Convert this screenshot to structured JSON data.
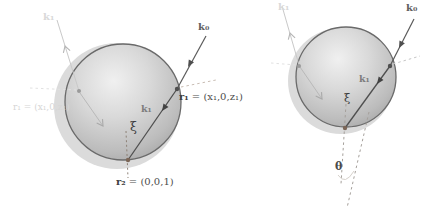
{
  "left": {
    "labels": {
      "k0": "k₀",
      "k1": "k₁",
      "xi": "ξ",
      "r1_bold": "r₁",
      "r1_rest": " = (x₁,0,z₁)",
      "r2_bold": "r₂",
      "r2_rest": " = (0,0,1)",
      "ghost_r1": "r₁ = (x₁,0,z₁)",
      "ghost_k": "k₁"
    }
  },
  "right": {
    "labels": {
      "k0": "k₀",
      "k1": "k₁",
      "xi": "ξ",
      "theta": "θ",
      "ghost_k": "k₁"
    }
  },
  "colors": {
    "sphere_outline": "#6a6a6a",
    "sphere_highlight": "#efefef",
    "sphere_shadow": "#a3a3a3",
    "ghost_sphere": "#dbdbdb",
    "arrow_dark": "#4f4f4f",
    "arrow_ghost": "#b5b5b5",
    "dashed_warm": "#a5a09b",
    "dashed_dark": "#8d8176",
    "dot_dark": "#4f4f4f",
    "dot_brown": "#7b6657",
    "label_dark": "#4d4d4d",
    "label_ghost": "#d6d6d6"
  }
}
